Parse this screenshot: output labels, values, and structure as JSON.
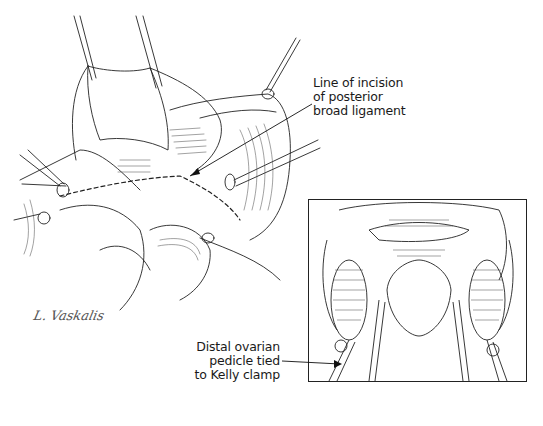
{
  "figure": {
    "type": "surgical illustration",
    "style": "black-and-white line art",
    "main_view": "pelvic operative field with uterus retracted by clamps, adnexa and broad ligament exposed",
    "inset_view": "close-up of uterus with bilateral ovarian pedicles clamped"
  },
  "callouts": [
    {
      "id": "incision",
      "lines": [
        "Line of incision",
        "of posterior",
        "broad ligament"
      ]
    },
    {
      "id": "pedicle",
      "lines": [
        "Distal ovarian",
        "pedicle tied",
        "to Kelly clamp"
      ]
    }
  ],
  "signature": "L. Vaskalis",
  "colors": {
    "ink": "#1a1a1a",
    "background": "#ffffff",
    "frame": "#222222"
  }
}
